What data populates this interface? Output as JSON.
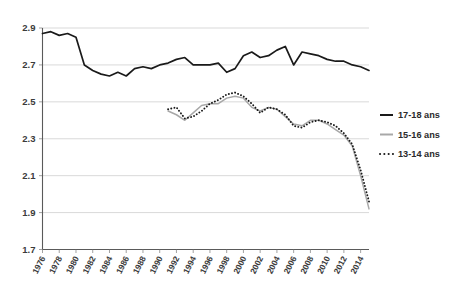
{
  "chart_data": {
    "type": "line",
    "title": "",
    "subtitle": "",
    "xlabel": "",
    "ylabel": "",
    "xlim": [
      1976,
      2015
    ],
    "ylim": [
      1.7,
      2.9
    ],
    "yticks": [
      "2.9",
      "2.7",
      "2.5",
      "2.3",
      "2.1",
      "1.9",
      "1.7"
    ],
    "ytick_values": [
      2.9,
      2.7,
      2.5,
      2.3,
      2.1,
      1.9,
      1.7
    ],
    "xticks": [
      "1976",
      "1978",
      "1980",
      "1982",
      "1984",
      "1986",
      "1988",
      "1990",
      "1992",
      "1994",
      "1996",
      "1998",
      "2000",
      "2002",
      "2004",
      "2006",
      "2008",
      "2010",
      "2012",
      "2014"
    ],
    "xtick_values": [
      1976,
      1978,
      1980,
      1982,
      1984,
      1986,
      1988,
      1990,
      1992,
      1994,
      1996,
      1998,
      2000,
      2002,
      2004,
      2006,
      2008,
      2010,
      2012,
      2014
    ],
    "grid": true,
    "grid_axis": "y",
    "legend_position": "right",
    "series": [
      {
        "name": "17-18 ans",
        "color": "#1a1a1a",
        "style": "solid",
        "x": [
          1976,
          1977,
          1978,
          1979,
          1980,
          1981,
          1982,
          1983,
          1984,
          1985,
          1986,
          1987,
          1988,
          1989,
          1990,
          1991,
          1992,
          1993,
          1994,
          1995,
          1996,
          1997,
          1998,
          1999,
          2000,
          2001,
          2002,
          2003,
          2004,
          2005,
          2006,
          2007,
          2008,
          2009,
          2010,
          2011,
          2012,
          2013,
          2014,
          2015
        ],
        "values": [
          2.87,
          2.88,
          2.86,
          2.87,
          2.85,
          2.7,
          2.67,
          2.65,
          2.64,
          2.66,
          2.64,
          2.68,
          2.69,
          2.68,
          2.7,
          2.71,
          2.73,
          2.74,
          2.7,
          2.7,
          2.7,
          2.71,
          2.66,
          2.68,
          2.75,
          2.77,
          2.74,
          2.75,
          2.78,
          2.8,
          2.7,
          2.77,
          2.76,
          2.75,
          2.73,
          2.72,
          2.72,
          2.7,
          2.69,
          2.67
        ]
      },
      {
        "name": "15-16 ans",
        "color": "#a8a8a8",
        "style": "solid",
        "x": [
          1991,
          1992,
          1993,
          1994,
          1995,
          1996,
          1997,
          1998,
          1999,
          2000,
          2001,
          2002,
          2003,
          2004,
          2005,
          2006,
          2007,
          2008,
          2009,
          2010,
          2011,
          2012,
          2013,
          2014,
          2015
        ],
        "values": [
          2.45,
          2.43,
          2.4,
          2.44,
          2.48,
          2.49,
          2.49,
          2.52,
          2.53,
          2.52,
          2.47,
          2.45,
          2.47,
          2.46,
          2.42,
          2.38,
          2.37,
          2.4,
          2.4,
          2.38,
          2.35,
          2.32,
          2.26,
          2.1,
          1.92
        ]
      },
      {
        "name": "13-14 ans",
        "color": "#1a1a1a",
        "style": "dotted",
        "x": [
          1991,
          1992,
          1993,
          1994,
          1995,
          1996,
          1997,
          1998,
          1999,
          2000,
          2001,
          2002,
          2003,
          2004,
          2005,
          2006,
          2007,
          2008,
          2009,
          2010,
          2011,
          2012,
          2013,
          2014,
          2015
        ],
        "values": [
          2.46,
          2.47,
          2.41,
          2.42,
          2.45,
          2.49,
          2.51,
          2.54,
          2.55,
          2.53,
          2.49,
          2.44,
          2.47,
          2.46,
          2.43,
          2.37,
          2.36,
          2.39,
          2.4,
          2.39,
          2.37,
          2.33,
          2.27,
          2.13,
          1.96
        ]
      }
    ]
  },
  "legend": {
    "items": [
      {
        "label": "17-18 ans"
      },
      {
        "label": "15-16 ans"
      },
      {
        "label": "13-14 ans"
      }
    ]
  }
}
